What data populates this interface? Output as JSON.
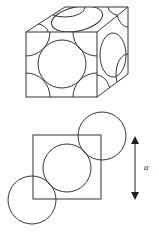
{
  "figure": {
    "top": {
      "description": "Face-centered cubic unit cell with atoms as spheres",
      "type": "fcc-unit-cell"
    },
    "bottom": {
      "description": "Face diagonal view of square face with three touching atoms",
      "dimension_label": "a"
    }
  },
  "colors": {
    "line": "#333333",
    "background": "#ffffff"
  }
}
